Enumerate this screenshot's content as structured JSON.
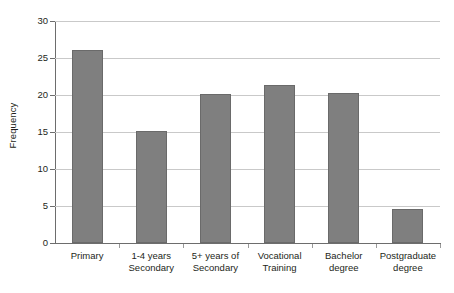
{
  "chart_data": {
    "type": "bar",
    "title": "",
    "xlabel": "",
    "ylabel": "Frequency",
    "categories": [
      "Primary",
      "1-4 years Secondary",
      "5+ years of Secondary",
      "Vocational Training",
      "Bachelor degree",
      "Postgraduate degree"
    ],
    "category_lines": [
      [
        "Primary"
      ],
      [
        "1-4 years",
        "Secondary"
      ],
      [
        "5+ years of",
        "Secondary"
      ],
      [
        "Vocational",
        "Training"
      ],
      [
        "Bachelor",
        "degree"
      ],
      [
        "Postgraduate",
        "degree"
      ]
    ],
    "values": [
      26.1,
      15.2,
      20.2,
      21.4,
      20.3,
      4.6
    ],
    "ylim": [
      0,
      30
    ],
    "yticks": [
      0,
      5,
      10,
      15,
      20,
      25,
      30
    ],
    "ytick_labels": [
      "0",
      "5",
      "10",
      "15",
      "20",
      "25",
      "30"
    ],
    "grid": true,
    "legend": "none",
    "bar_color": "#7f7f7f",
    "bar_border_color": "#6a6a6a",
    "gridline_color": "#c9c9c9",
    "axis_color": "#6d6d6d",
    "background_color": "#ffffff"
  }
}
